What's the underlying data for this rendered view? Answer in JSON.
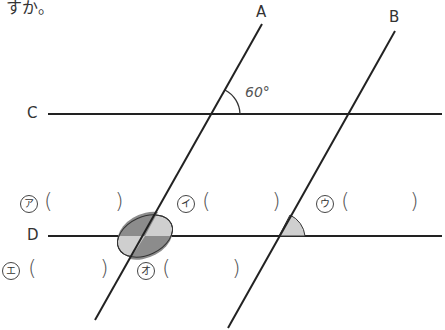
{
  "header_fragment": "すか。",
  "lines": {
    "A": "A",
    "B": "B",
    "C": "C",
    "D": "D"
  },
  "angle_given": "60°",
  "answer_slots": [
    {
      "id": "ア",
      "label": "ア"
    },
    {
      "id": "イ",
      "label": "イ"
    },
    {
      "id": "ウ",
      "label": "ウ"
    },
    {
      "id": "エ",
      "label": "エ"
    },
    {
      "id": "オ",
      "label": "オ"
    }
  ],
  "paren_open": "(",
  "paren_close": ")",
  "colors": {
    "line": "#222222",
    "shade_dark": "#8c8c8c",
    "shade_light": "#cfcfcf"
  }
}
